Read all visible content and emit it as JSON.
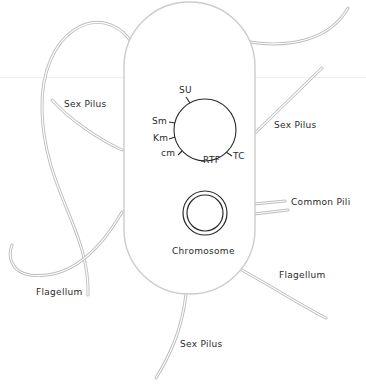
{
  "figure": {
    "cell": {
      "name": "bacterial-cell"
    },
    "plasmid": {
      "genes": [
        {
          "label": "SU"
        },
        {
          "label": "Sm"
        },
        {
          "label": "Km"
        },
        {
          "label": "cm"
        },
        {
          "label": "RTF"
        },
        {
          "label": "TC"
        }
      ]
    },
    "chromosome": {
      "label": "Chromosome"
    },
    "appendages": [
      {
        "label": "Sex Pilus",
        "position": "upper-left"
      },
      {
        "label": "Sex Pilus",
        "position": "right"
      },
      {
        "label": "Common Pili",
        "position": "right"
      },
      {
        "label": "Flagellum",
        "position": "lower-left"
      },
      {
        "label": "Flagellum",
        "position": "lower-right"
      },
      {
        "label": "Sex Pilus",
        "position": "bottom"
      }
    ],
    "colors": {
      "outline": "#c8c8c8",
      "ink": "#2a2a2a",
      "background": "#ffffff"
    }
  }
}
